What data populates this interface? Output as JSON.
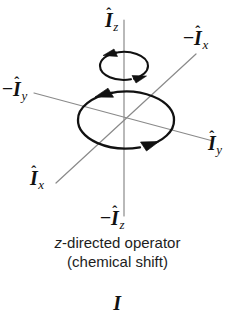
{
  "figure": {
    "title": "z-directed operator (chemical shift)",
    "background_color": "#ffffff",
    "axis_line_color": "#8a8a8a",
    "curve_color": "#111111",
    "text_color": "#1a1a1a"
  },
  "axis_labels": {
    "z_positive": {
      "sign": "",
      "symbol": "I",
      "hat": "ˆ",
      "subscript": "z",
      "text": "Î_z"
    },
    "z_negative": {
      "sign": "−",
      "symbol": "I",
      "hat": "ˆ",
      "subscript": "z",
      "text": "−Î_z"
    },
    "x_positive": {
      "sign": "",
      "symbol": "I",
      "hat": "ˆ",
      "subscript": "x",
      "text": "Î_x"
    },
    "x_negative": {
      "sign": "−",
      "symbol": "I",
      "hat": "ˆ",
      "subscript": "x",
      "text": "−Î_x"
    },
    "y_positive": {
      "sign": "",
      "symbol": "I",
      "hat": "ˆ",
      "subscript": "y",
      "text": "Î_y"
    },
    "y_negative": {
      "sign": "−",
      "symbol": "I",
      "hat": "ˆ",
      "subscript": "y",
      "text": "−Î_y"
    }
  },
  "caption": {
    "line1_italic": "z",
    "line1_rest": "-directed operator",
    "line2": "(chemical shift)"
  },
  "bottom_glyph": {
    "sign": "",
    "symbol": "I",
    "hat": "ˆ",
    "subscript": "",
    "text": "Î"
  },
  "diagram": {
    "center": {
      "x": 124,
      "y": 120
    },
    "axes": [
      {
        "name": "z-axis",
        "x1": 124,
        "y1": 20,
        "x2": 124,
        "y2": 216
      },
      {
        "name": "y-axis",
        "x1": 34,
        "y1": 93,
        "x2": 213,
        "y2": 141
      },
      {
        "name": "x-axis",
        "x1": 56,
        "y1": 183,
        "x2": 196,
        "y2": 54
      }
    ],
    "rotation_ellipses": [
      {
        "name": "upper-precession-loop",
        "cx": 124,
        "cy": 66,
        "rx": 24,
        "ry": 14,
        "direction": "counterclockwise-from-above",
        "arrowheads": 2
      },
      {
        "name": "equatorial-precession-loop",
        "cx": 126,
        "cy": 120,
        "rx": 48,
        "ry": 28,
        "direction": "counterclockwise-from-above",
        "arrowheads": 2
      }
    ]
  }
}
